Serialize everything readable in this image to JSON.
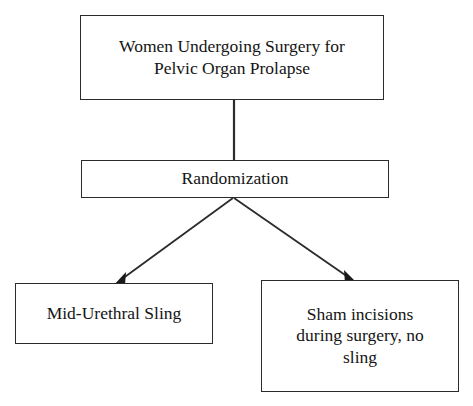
{
  "diagram": {
    "background_color": "#ffffff",
    "line_color": "#2b2b2b",
    "text_color": "#141414",
    "nodes": {
      "population": {
        "label": "Women Undergoing Surgery for\nPelvic Organ Prolapse",
        "shape": "rectangle"
      },
      "randomization": {
        "label": "Randomization",
        "shape": "rectangle"
      },
      "arm_sling": {
        "label": "Mid-Urethral Sling",
        "shape": "rectangle"
      },
      "arm_sham": {
        "label": "Sham incisions\nduring surgery, no\nsling",
        "shape": "rectangle"
      }
    },
    "connectors": [
      {
        "name": "population-to-randomization",
        "from": "population",
        "to": "randomization",
        "style": "plain-line",
        "arrowhead": "none"
      },
      {
        "name": "randomization-to-sling",
        "from": "randomization",
        "to": "arm_sling",
        "style": "diagonal-line",
        "arrowhead": "solid-triangle"
      },
      {
        "name": "randomization-to-sham",
        "from": "randomization",
        "to": "arm_sham",
        "style": "diagonal-line",
        "arrowhead": "solid-triangle"
      }
    ]
  }
}
